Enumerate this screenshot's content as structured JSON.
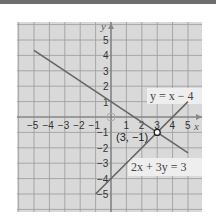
{
  "chart_data": {
    "type": "line",
    "title": "",
    "xlabel": "x",
    "ylabel": "y",
    "xlim": [
      -6,
      6
    ],
    "ylim": [
      -6,
      6
    ],
    "grid": true,
    "x_ticks": [
      "-5",
      "-4",
      "-3",
      "-2",
      "-1",
      "1",
      "2",
      "3",
      "4",
      "5"
    ],
    "y_ticks": [
      "5",
      "4",
      "3",
      "2",
      "1",
      "-1",
      "-2",
      "-3",
      "-4",
      "-5"
    ],
    "series": [
      {
        "name": "y = x − 4",
        "equation": "y = x - 4",
        "x": [
          -1,
          5
        ],
        "y": [
          -5,
          1
        ]
      },
      {
        "name": "2x + 3y = 3",
        "equation": "2x + 3y = 3",
        "x": [
          -5,
          5
        ],
        "y": [
          4.33,
          -2.33
        ]
      }
    ],
    "annotations": [
      {
        "text": "(3, −1)",
        "x": 3,
        "y": -1,
        "marker": "open-circle"
      },
      {
        "text": "origin",
        "x": 0,
        "y": 0,
        "marker": "open-circle"
      }
    ],
    "legend": {
      "line1_label": "y = x − 4",
      "line2_label": "2x + 3y = 3"
    },
    "intersection_label": "(3, −1)",
    "axis_x_label": "x",
    "axis_y_label": "y"
  }
}
